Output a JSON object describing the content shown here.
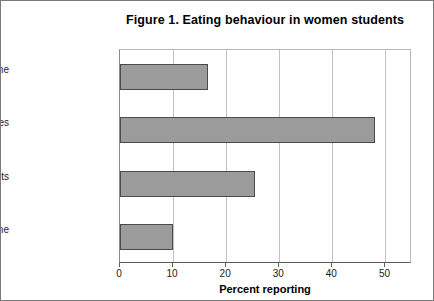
{
  "figure": {
    "title": "Figure 1. Eating behaviour in women students"
  },
  "chart_data": {
    "type": "bar",
    "orientation": "horizontal",
    "title": "Figure 1. Eating behaviour in women students",
    "xlabel": "Percent reporting",
    "ylabel": "",
    "categories": [
      "diets most or all of time",
      "occasional diet and watches",
      "watches never diets",
      "none"
    ],
    "values": [
      16.5,
      48,
      25.5,
      10
    ],
    "xlim": [
      0,
      55
    ],
    "xticks": [
      0,
      10,
      20,
      30,
      40,
      50
    ],
    "xtick_labels": [
      "0",
      "10",
      "20",
      "30",
      "40",
      "50"
    ],
    "grid": "vertical",
    "legend": "none",
    "bar_fill_color": "#9b9b9b",
    "bar_border_color": "#4a4a4a"
  }
}
